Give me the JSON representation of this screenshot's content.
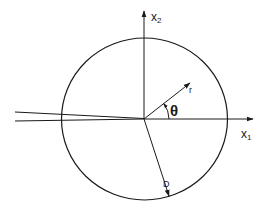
{
  "diagram": {
    "type": "crack-tip coordinate system",
    "labels": {
      "x1_base": "x",
      "x1_sub": "1",
      "x2_base": "x",
      "x2_sub": "2",
      "r": "r",
      "theta": "θ",
      "D": "D"
    },
    "elements": {
      "circle": {
        "cx": 144.5,
        "cy": 119,
        "rx": 83,
        "ry": 81
      },
      "origin": {
        "x": 144,
        "y": 119
      },
      "x1_axis_end": {
        "x": 253,
        "y": 119
      },
      "x2_axis_end": {
        "x": 144,
        "y": 10
      },
      "r_vector_end": {
        "x": 190,
        "y": 83
      },
      "D_vector_end": {
        "x": 169,
        "y": 196
      },
      "crack_upper_start": {
        "x": 15,
        "y": 112
      },
      "crack_lower_start": {
        "x": 15,
        "y": 121
      }
    },
    "colors": {
      "stroke": "#1a1a1a",
      "background": "#ffffff"
    }
  }
}
